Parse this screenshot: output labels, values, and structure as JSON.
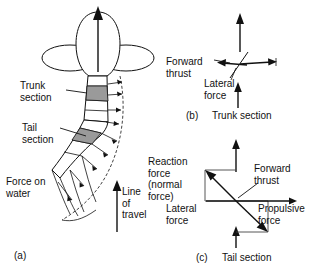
{
  "figure": {
    "ink_color": "#111111",
    "shade_color": "#9a9a9a",
    "background": "#ffffff"
  },
  "panel_a": {
    "caption": "(a)",
    "labels": {
      "trunk_section": "Trunk\nsection",
      "tail_section": "Tail\nsection",
      "force_on_water": "Force on\nwater",
      "line_of_travel": "Line\nof\ntravel"
    }
  },
  "panel_b": {
    "caption_index": "(b)",
    "caption_text": "Trunk section",
    "labels": {
      "forward_thrust": "Forward\nthrust",
      "lateral_force": "Lateral\nforce"
    }
  },
  "panel_c": {
    "caption_index": "(c)",
    "caption_text": "Tail section",
    "labels": {
      "reaction_force": "Reaction\nforce\n(normal\nforce)",
      "forward_thrust": "Forward\nthrust",
      "lateral_force": "Lateral\nforce",
      "propulsive_force": "Propulsive\nforce"
    }
  }
}
